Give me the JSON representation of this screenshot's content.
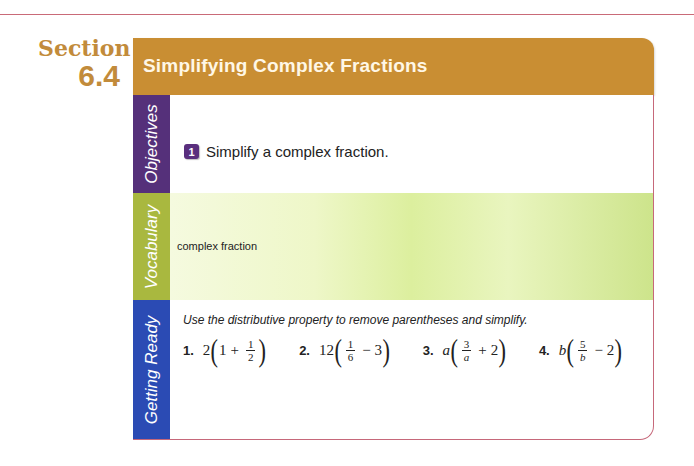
{
  "section": {
    "label": "Section",
    "number": "6.4"
  },
  "header": {
    "title": "Simplifying Complex Fractions",
    "color": "#c98e33"
  },
  "tabs": {
    "objectives": {
      "label": "Objectives",
      "color": "#55307a"
    },
    "vocabulary": {
      "label": "Vocabulary",
      "color": "#a9b83f"
    },
    "getting_ready": {
      "label": "Getting Ready",
      "color": "#2b4bb4"
    }
  },
  "objectives": [
    {
      "number": "1",
      "text": "Simplify a complex fraction."
    }
  ],
  "vocabulary": [
    "complex fraction"
  ],
  "getting_ready": {
    "instructions": "Use the distributive property to remove parentheses and simplify.",
    "exercises": [
      {
        "number": "1.",
        "coef": "2",
        "lead": "1",
        "op1": "+",
        "num": "1",
        "den": "2",
        "op2": "",
        "tail": ""
      },
      {
        "number": "2.",
        "coef": "12",
        "lead": "",
        "op1": "",
        "num": "1",
        "den": "6",
        "op2": "−",
        "tail": "3"
      },
      {
        "number": "3.",
        "coef": "a",
        "lead": "",
        "op1": "",
        "num": "3",
        "den": "a",
        "op2": "+",
        "tail": "2"
      },
      {
        "number": "4.",
        "coef": "b",
        "lead": "",
        "op1": "",
        "num": "5",
        "den": "b",
        "op2": "−",
        "tail": "2"
      }
    ]
  }
}
